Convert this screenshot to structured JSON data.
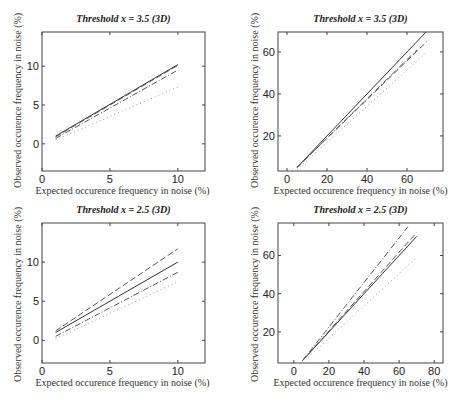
{
  "chart_data": [
    {
      "type": "line",
      "title": "Threshold x = 3.5 (3D)",
      "xlabel": "Expected occurence frequency in noise (%)",
      "ylabel": "Observed occurence frequency in noise (%)",
      "xlim": [
        0,
        12
      ],
      "ylim": [
        -3.5,
        14.4
      ],
      "xticks": [
        0,
        5,
        10
      ],
      "yticks": [
        0,
        5,
        10
      ],
      "grid": false,
      "series": [
        {
          "name": "solid",
          "style": "solid",
          "x": [
            1,
            10
          ],
          "y": [
            1.0,
            10.2
          ]
        },
        {
          "name": "dashed",
          "style": "dashed",
          "x": [
            1,
            10
          ],
          "y": [
            0.9,
            10.1
          ]
        },
        {
          "name": "dash-dot",
          "style": "dashdot",
          "x": [
            1,
            10
          ],
          "y": [
            0.7,
            9.5
          ]
        },
        {
          "name": "dotted",
          "style": "dotted",
          "x": [
            1,
            10
          ],
          "y": [
            0.5,
            7.3
          ]
        }
      ]
    },
    {
      "type": "line",
      "title": "Threshold x = 3.5 (3D)",
      "xlabel": "Expected occurence frequency in noise (%)",
      "ylabel": "Observed occurence frequency in noise (%)",
      "xlim": [
        -4.5,
        78
      ],
      "ylim": [
        3.3,
        69.5
      ],
      "xticks": [
        0,
        20,
        40,
        60
      ],
      "yticks": [
        20,
        40,
        60
      ],
      "grid": false,
      "series": [
        {
          "name": "solid",
          "style": "solid",
          "x": [
            5,
            70
          ],
          "y": [
            5,
            70
          ]
        },
        {
          "name": "dashed",
          "style": "dashed",
          "x": [
            5,
            70
          ],
          "y": [
            5,
            65
          ]
        },
        {
          "name": "dash-dot",
          "style": "dashdot",
          "x": [
            5,
            65
          ],
          "y": [
            5,
            61
          ]
        },
        {
          "name": "dotted",
          "style": "dotted",
          "x": [
            5,
            70
          ],
          "y": [
            4,
            60
          ]
        }
      ]
    },
    {
      "type": "line",
      "title": "Threshold x = 2.5 (3D)",
      "xlabel": "Expected occurence frequency in noise (%)",
      "ylabel": "Observed occurence frequency in noise (%)",
      "xlim": [
        0,
        12
      ],
      "ylim": [
        -2.9,
        15.0
      ],
      "xticks": [
        0,
        5,
        10
      ],
      "yticks": [
        0,
        5,
        10
      ],
      "grid": false,
      "series": [
        {
          "name": "solid",
          "style": "solid",
          "x": [
            1,
            10
          ],
          "y": [
            1.0,
            10.0
          ]
        },
        {
          "name": "dashed",
          "style": "dashed",
          "x": [
            1,
            10
          ],
          "y": [
            1.2,
            11.7
          ]
        },
        {
          "name": "dash-dot",
          "style": "dashdot",
          "x": [
            1,
            10
          ],
          "y": [
            0.5,
            8.7
          ]
        },
        {
          "name": "dotted",
          "style": "dotted",
          "x": [
            1,
            10
          ],
          "y": [
            0.2,
            7.5
          ]
        }
      ]
    },
    {
      "type": "line",
      "title": "Threshold x = 2.5 (3D)",
      "xlabel": "Expected occurence frequency in noise (%)",
      "ylabel": "Observed occurence frequency in noise (%)",
      "xlim": [
        -9,
        85
      ],
      "ylim": [
        3.7,
        77
      ],
      "xticks": [
        0,
        20,
        40,
        60,
        80
      ],
      "yticks": [
        20,
        40,
        60
      ],
      "grid": false,
      "series": [
        {
          "name": "solid",
          "style": "solid",
          "x": [
            5,
            70
          ],
          "y": [
            5,
            70
          ]
        },
        {
          "name": "dashed",
          "style": "dashed",
          "x": [
            5,
            70
          ],
          "y": [
            5,
            72
          ]
        },
        {
          "name": "dash-dot",
          "style": "dashdot",
          "x": [
            5,
            65
          ],
          "y": [
            5,
            75
          ]
        },
        {
          "name": "dotted",
          "style": "dotted",
          "x": [
            5,
            70
          ],
          "y": [
            4,
            59
          ]
        }
      ]
    }
  ],
  "layout": [
    {
      "box": [
        42,
        32,
        205,
        171
      ]
    },
    {
      "box": [
        278,
        32,
        443,
        171
      ]
    },
    {
      "box": [
        42,
        223,
        205,
        363
      ]
    },
    {
      "box": [
        278,
        223,
        443,
        363
      ]
    }
  ]
}
